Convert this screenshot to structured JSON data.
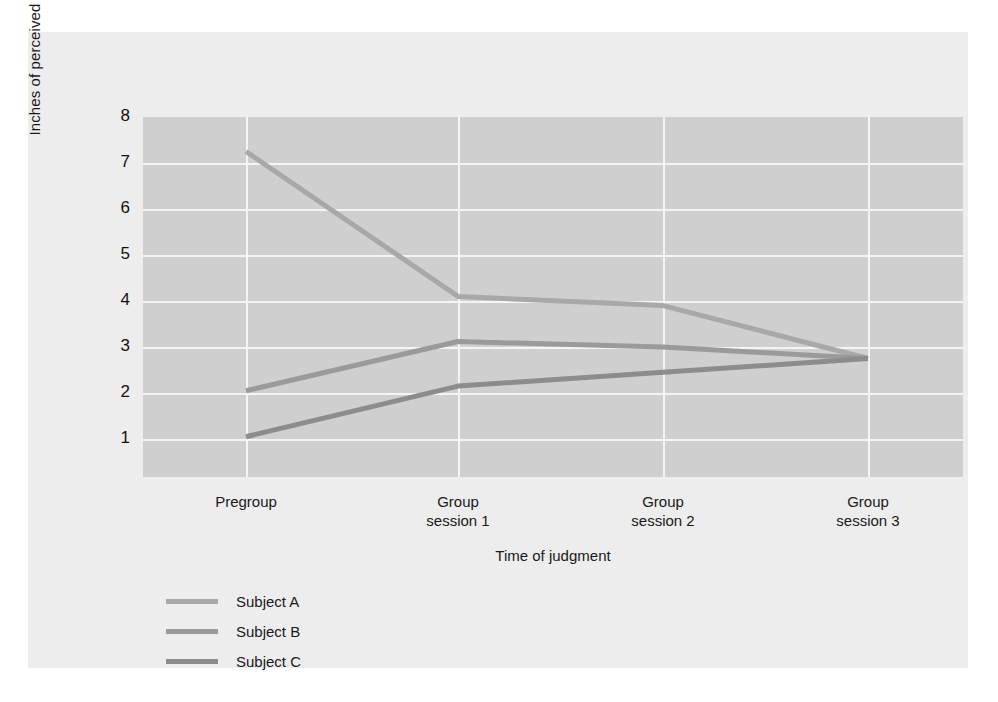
{
  "figure": {
    "background_color": "#ededed",
    "plot_background_color": "#cfcfcf",
    "gridline_color": "#f4f4f4"
  },
  "chart_data": {
    "type": "line",
    "title": "",
    "subtitle": "",
    "xlabel": "Time of judgment",
    "ylabel": "Inches of perceived movement",
    "categories": [
      "Pregroup",
      "Group\nsession 1",
      "Group\nsession 2",
      "Group\nsession 3"
    ],
    "category_labels": [
      {
        "line1": "Pregroup",
        "line2": ""
      },
      {
        "line1": "Group",
        "line2": "session 1"
      },
      {
        "line1": "Group",
        "line2": "session 2"
      },
      {
        "line1": "Group",
        "line2": "session 3"
      }
    ],
    "ylim": [
      0,
      8
    ],
    "yticks": [
      8,
      7,
      6,
      5,
      4,
      3,
      2,
      1
    ],
    "ytick_labels": [
      "8",
      "7",
      "6",
      "5",
      "4",
      "3",
      "2",
      "1"
    ],
    "grid": true,
    "legend_position": "below-left",
    "series": [
      {
        "name": "Subject A",
        "color": "#a8a8a8",
        "values": [
          7.25,
          4.1,
          3.9,
          2.75
        ]
      },
      {
        "name": "Subject B",
        "color": "#9a9a9a",
        "values": [
          2.05,
          3.12,
          3.0,
          2.75
        ]
      },
      {
        "name": "Subject C",
        "color": "#8c8c8c",
        "values": [
          1.05,
          2.15,
          2.45,
          2.75
        ]
      }
    ]
  },
  "legend": {
    "items": [
      {
        "label": "Subject A",
        "color": "#a8a8a8"
      },
      {
        "label": "Subject B",
        "color": "#9a9a9a"
      },
      {
        "label": "Subject C",
        "color": "#8c8c8c"
      }
    ]
  }
}
